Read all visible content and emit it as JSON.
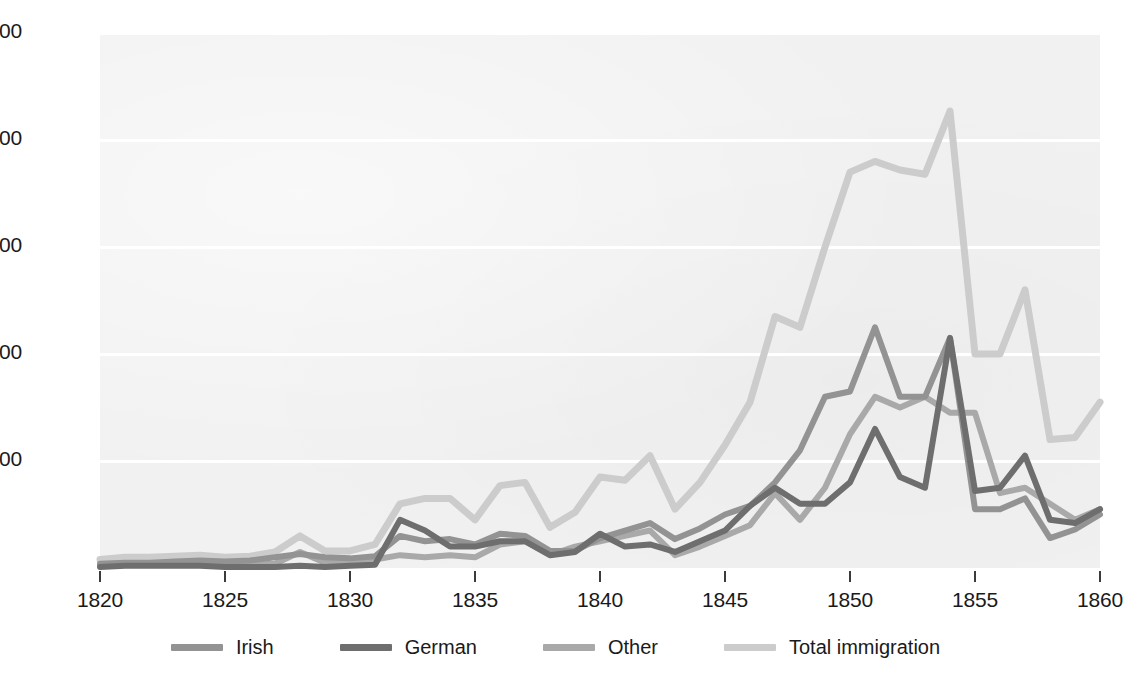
{
  "chart_data": {
    "type": "line",
    "title": "",
    "subtitle": "",
    "xlabel": "",
    "ylabel": "",
    "x": [
      1820,
      1821,
      1822,
      1823,
      1824,
      1825,
      1826,
      1827,
      1828,
      1829,
      1830,
      1831,
      1832,
      1833,
      1834,
      1835,
      1836,
      1837,
      1838,
      1839,
      1840,
      1841,
      1842,
      1843,
      1844,
      1845,
      1846,
      1847,
      1848,
      1849,
      1850,
      1851,
      1852,
      1853,
      1854,
      1855,
      1856,
      1857,
      1858,
      1859,
      1860
    ],
    "xlim": [
      1820,
      1860
    ],
    "ylim": [
      0,
      500000
    ],
    "xticks": [
      1820,
      1825,
      1830,
      1835,
      1840,
      1845,
      1850,
      1855,
      1860
    ],
    "xtick_labels": [
      "1820",
      "1825",
      "1830",
      "1835",
      "1840",
      "1845",
      "1850",
      "1855",
      "1860"
    ],
    "yticks": [
      100000,
      200000,
      300000,
      400000,
      500000
    ],
    "ytick_labels": [
      "100,000",
      "200,000",
      "300,000",
      "400,000",
      "500,000"
    ],
    "grid": "horizontal",
    "legend_position": "bottom",
    "series": [
      {
        "name": "Irish",
        "color": "#939393",
        "values": [
          4000,
          5000,
          5000,
          6000,
          7000,
          6000,
          7000,
          10000,
          13000,
          10000,
          9000,
          11000,
          30000,
          25000,
          27000,
          22000,
          32000,
          30000,
          16000,
          16000,
          28000,
          35000,
          42000,
          27000,
          37000,
          50000,
          58000,
          80000,
          110000,
          160000,
          165000,
          225000,
          160000,
          160000,
          215000,
          55000,
          55000,
          65000,
          28000,
          36000,
          50000
        ]
      },
      {
        "name": "German",
        "color": "#6e6e6e",
        "values": [
          1000,
          2000,
          2000,
          2000,
          2000,
          1000,
          1000,
          1000,
          2000,
          1000,
          2000,
          3000,
          45000,
          35000,
          20000,
          20000,
          25000,
          25000,
          12000,
          15000,
          32000,
          20000,
          22000,
          15000,
          25000,
          35000,
          58000,
          75000,
          60000,
          60000,
          80000,
          130000,
          85000,
          75000,
          215000,
          72000,
          75000,
          105000,
          45000,
          42000,
          55000
        ]
      },
      {
        "name": "Other",
        "color": "#a9a9a9",
        "values": [
          3000,
          3000,
          3000,
          3000,
          3000,
          3000,
          3000,
          4000,
          15000,
          5000,
          5000,
          8000,
          12000,
          10000,
          12000,
          10000,
          22000,
          25000,
          12000,
          20000,
          25000,
          30000,
          35000,
          12000,
          20000,
          30000,
          40000,
          70000,
          45000,
          75000,
          125000,
          160000,
          150000,
          160000,
          145000,
          145000,
          70000,
          75000,
          60000,
          45000,
          55000
        ]
      },
      {
        "name": "Total immigration",
        "color": "#cccccc",
        "values": [
          8000,
          10000,
          10000,
          11000,
          12000,
          10000,
          11000,
          15000,
          30000,
          16000,
          16000,
          22000,
          60000,
          65000,
          65000,
          45000,
          77000,
          80000,
          38000,
          52000,
          85000,
          82000,
          105000,
          55000,
          80000,
          115000,
          155000,
          235000,
          225000,
          300000,
          370000,
          380000,
          372000,
          368000,
          427000,
          200000,
          200000,
          260000,
          120000,
          122000,
          155000
        ]
      }
    ]
  },
  "axis": {
    "y_labels": [
      "500,000",
      "400,000",
      "300,000",
      "200,000",
      "100,000"
    ],
    "x_labels": [
      "1820",
      "1825",
      "1830",
      "1835",
      "1840",
      "1845",
      "1850",
      "1855",
      "1860"
    ]
  },
  "legend": {
    "items": [
      {
        "label": "Irish",
        "color": "#939393"
      },
      {
        "label": "German",
        "color": "#6e6e6e"
      },
      {
        "label": "Other",
        "color": "#a9a9a9"
      },
      {
        "label": "Total immigration",
        "color": "#cccccc"
      }
    ]
  },
  "colors": {
    "plot_background": "#f1f1f1",
    "gridline": "#ffffff",
    "text": "#1a1a1a",
    "tick": "#3b3b3b"
  }
}
